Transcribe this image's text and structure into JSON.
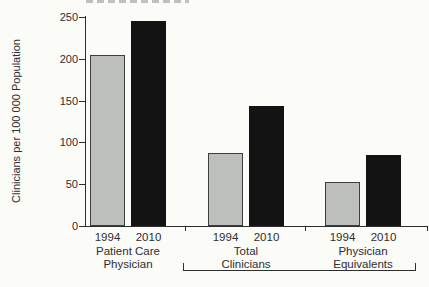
{
  "figure": {
    "cropped_top_text_note": "illegible text cropped at top edge"
  },
  "chart_data": {
    "type": "bar",
    "title": "",
    "ylabel": "Clinicians per 100 000 Population",
    "xlabel": "",
    "ylim": [
      0,
      250
    ],
    "yticks": [
      0,
      50,
      100,
      150,
      200,
      250
    ],
    "grid": false,
    "legend_position": "none",
    "categories": [
      "Patient Care Physician",
      "Total Clinicians",
      "Physician Equivalents"
    ],
    "category_label_lines": [
      [
        "Patient Care",
        "Physician"
      ],
      [
        "Total",
        "Clinicians"
      ],
      [
        "Physician",
        "Equivalents"
      ]
    ],
    "series": [
      {
        "name": "1994",
        "color": "#bcbfbc",
        "border": "#3e3e3e",
        "values": [
          205,
          87,
          53
        ]
      },
      {
        "name": "2010",
        "color": "#131313",
        "border": "#131313",
        "values": [
          245,
          144,
          85
        ]
      }
    ],
    "bar_tick_labels": [
      "1994",
      "2010"
    ],
    "axis_color": "#2e2e2e",
    "bracket_spans": [
      "Total Clinicians",
      "Physician Equivalents"
    ]
  }
}
